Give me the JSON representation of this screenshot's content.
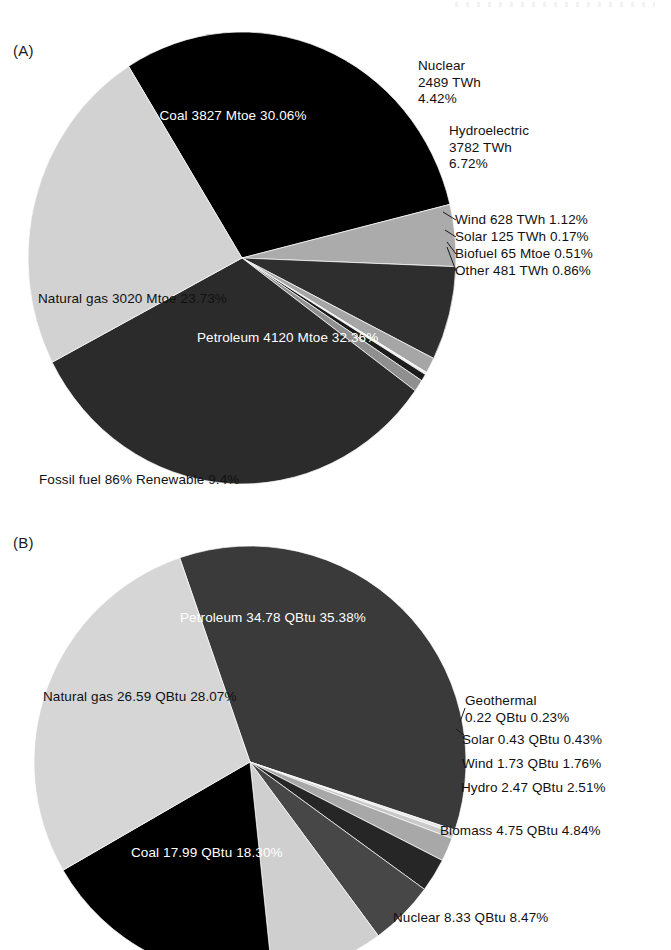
{
  "figure": {
    "panels": [
      {
        "letter": "(A)"
      },
      {
        "letter": "(B)"
      }
    ],
    "caption_a": "Fossil fuel 86% Renewable 9.4%"
  },
  "chart_data": [
    {
      "type": "pie",
      "title": "(A)",
      "panel": "A",
      "unit_note": "Mtoe / TWh mixed units as printed",
      "annotation": "Fossil fuel 86% Renewable 9.4%",
      "legend_position": "outside-right",
      "grid": false,
      "categories": [
        "Coal",
        "Petroleum",
        "Natural gas",
        "Nuclear",
        "Hydroelectric",
        "Wind",
        "Solar",
        "Biofuel",
        "Other"
      ],
      "values": [
        30.06,
        32.36,
        23.73,
        4.42,
        6.72,
        1.12,
        0.17,
        0.51,
        0.86
      ],
      "slices": [
        {
          "name": "Coal",
          "line1": "Coal",
          "line2": "3827 Mtoe",
          "line3": "30.06%",
          "amount": "3827",
          "unit": "Mtoe",
          "percent": "30.06%",
          "percent_value": 30.06,
          "color": "#000000",
          "text_color": "#ffffff",
          "placement": "inside"
        },
        {
          "name": "Nuclear",
          "line1": "Nuclear",
          "line2": "2489 TWh",
          "line3": "4.42%",
          "amount": "2489",
          "unit": "TWh",
          "percent": "4.42%",
          "percent_value": 4.42,
          "color": "#ababab",
          "text_color": "#111111",
          "placement": "outside"
        },
        {
          "name": "Hydroelectric",
          "line1": "Hydroelectric",
          "line2": "3782 TWh",
          "line3": "6.72%",
          "amount": "3782",
          "unit": "TWh",
          "percent": "6.72%",
          "percent_value": 6.72,
          "color": "#2e2e2e",
          "text_color": "#111111",
          "placement": "outside"
        },
        {
          "name": "Wind",
          "single": "Wind 628 TWh 1.12%",
          "amount": "628",
          "unit": "TWh",
          "percent": "1.12%",
          "percent_value": 1.12,
          "color": "#a6a6a6",
          "text_color": "#111111",
          "placement": "outside"
        },
        {
          "name": "Solar",
          "single": "Solar 125 TWh 0.17%",
          "amount": "125",
          "unit": "TWh",
          "percent": "0.17%",
          "percent_value": 0.17,
          "color": "#efefef",
          "text_color": "#111111",
          "placement": "outside"
        },
        {
          "name": "Biofuel",
          "single": "Biofuel 65 Mtoe 0.51%",
          "amount": "65",
          "unit": "Mtoe",
          "percent": "0.51%",
          "percent_value": 0.51,
          "color": "#1c1c1c",
          "text_color": "#111111",
          "placement": "outside"
        },
        {
          "name": "Other",
          "single": "Other 481 TWh 0.86%",
          "amount": "481",
          "unit": "TWh",
          "percent": "0.86%",
          "percent_value": 0.86,
          "color": "#8f8f8f",
          "text_color": "#111111",
          "placement": "outside"
        },
        {
          "name": "Petroleum",
          "line1": "Petroleum",
          "line2": "4120 Mtoe",
          "line3": "32.36%",
          "amount": "4120",
          "unit": "Mtoe",
          "percent": "32.36%",
          "percent_value": 32.36,
          "color": "#2b2b2b",
          "text_color": "#ffffff",
          "placement": "inside"
        },
        {
          "name": "Natural gas",
          "line1": "Natural gas",
          "line2": "3020 Mtoe",
          "line3": "23.73%",
          "amount": "3020",
          "unit": "Mtoe",
          "percent": "23.73%",
          "percent_value": 23.73,
          "color": "#d2d2d2",
          "text_color": "#111111",
          "placement": "inside"
        }
      ]
    },
    {
      "type": "pie",
      "title": "(B)",
      "panel": "B",
      "unit_note": "QBtu",
      "legend_position": "outside-right",
      "grid": false,
      "categories": [
        "Petroleum",
        "Geothermal",
        "Solar",
        "Wind",
        "Hydro",
        "Biomass",
        "Nuclear",
        "Coal",
        "Natural gas"
      ],
      "values": [
        35.38,
        0.23,
        0.43,
        1.76,
        2.51,
        4.84,
        8.47,
        18.3,
        28.07
      ],
      "slices": [
        {
          "name": "Petroleum",
          "line1": "Petroleum",
          "line2": "34.78 QBtu",
          "line3": "35.38%",
          "amount": "34.78",
          "unit": "QBtu",
          "percent": "35.38%",
          "percent_value": 35.38,
          "color": "#3a3a3a",
          "text_color": "#ffffff",
          "placement": "inside"
        },
        {
          "name": "Geothermal",
          "line1": "Geothermal",
          "line2": "0.22 QBtu 0.23%",
          "amount": "0.22",
          "unit": "QBtu",
          "percent": "0.23%",
          "percent_value": 0.23,
          "color": "#e8e8e8",
          "text_color": "#111111",
          "placement": "outside"
        },
        {
          "name": "Solar",
          "single": "Solar 0.43 QBtu 0.43%",
          "amount": "0.43",
          "unit": "QBtu",
          "percent": "0.43%",
          "percent_value": 0.43,
          "color": "#c9c9c9",
          "text_color": "#111111",
          "placement": "outside"
        },
        {
          "name": "Wind",
          "single": "Wind 1.73 QBtu 1.76%",
          "amount": "1.73",
          "unit": "QBtu",
          "percent": "1.76%",
          "percent_value": 1.76,
          "color": "#a8a8a8",
          "text_color": "#111111",
          "placement": "outside"
        },
        {
          "name": "Hydro",
          "single": "Hydro 2.47 QBtu 2.51%",
          "amount": "2.47",
          "unit": "QBtu",
          "percent": "2.51%",
          "percent_value": 2.51,
          "color": "#262626",
          "text_color": "#111111",
          "placement": "outside"
        },
        {
          "name": "Biomass",
          "single": "Biomass 4.75 QBtu 4.84%",
          "amount": "4.75",
          "unit": "QBtu",
          "percent": "4.84%",
          "percent_value": 4.84,
          "color": "#474747",
          "text_color": "#111111",
          "placement": "outside"
        },
        {
          "name": "Nuclear",
          "single": "Nuclear 8.33 QBtu 8.47%",
          "amount": "8.33",
          "unit": "QBtu",
          "percent": "8.47%",
          "percent_value": 8.47,
          "color": "#cfcfcf",
          "text_color": "#111111",
          "placement": "outside"
        },
        {
          "name": "Coal",
          "line1": "Coal",
          "line2": "17.99 QBtu",
          "line3": "18.30%",
          "amount": "17.99",
          "unit": "QBtu",
          "percent": "18.30%",
          "percent_value": 18.3,
          "color": "#000000",
          "text_color": "#ffffff",
          "placement": "inside"
        },
        {
          "name": "Natural gas",
          "line1": "Natural gas",
          "line2": "26.59 QBtu",
          "line3": "28.07%",
          "amount": "26.59",
          "unit": "QBtu",
          "percent": "28.07%",
          "percent_value": 28.07,
          "color": "#d6d6d6",
          "text_color": "#111111",
          "placement": "inside"
        }
      ]
    }
  ]
}
